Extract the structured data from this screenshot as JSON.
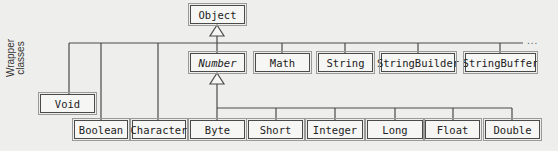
{
  "diagram": {
    "type": "class-hierarchy",
    "root": "Object",
    "side_label": {
      "line1": "Wrapper",
      "line2": "classes"
    },
    "ellipsis": "...",
    "object_children": [
      "Number",
      "Math",
      "String",
      "StringBuilder",
      "StringBuffer",
      "Void",
      "Boolean",
      "Character"
    ],
    "number_children": [
      "Byte",
      "Short",
      "Integer",
      "Long",
      "Float",
      "Double"
    ],
    "classes": {
      "object": {
        "label": "Object",
        "abstract": false
      },
      "number": {
        "label": "Number",
        "abstract": true
      },
      "math": {
        "label": "Math"
      },
      "string": {
        "label": "String"
      },
      "string_builder": {
        "label": "StringBuilder"
      },
      "string_buffer": {
        "label": "StringBuffer"
      },
      "void": {
        "label": "Void"
      },
      "boolean": {
        "label": "Boolean"
      },
      "character": {
        "label": "Character"
      },
      "byte": {
        "label": "Byte"
      },
      "short": {
        "label": "Short"
      },
      "integer": {
        "label": "Integer"
      },
      "long": {
        "label": "Long"
      },
      "float": {
        "label": "Float"
      },
      "double": {
        "label": "Double"
      }
    },
    "colors": {
      "line": "#4a4a4a",
      "background": "#eeeeec",
      "text": "#222222"
    }
  }
}
